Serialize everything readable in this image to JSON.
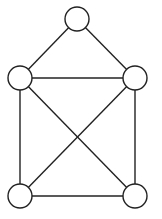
{
  "diagram": {
    "type": "graph",
    "stroke_color": "#222222",
    "fill_color": "#ffffff",
    "node_radius": 12,
    "nodes": [
      {
        "id": "top",
        "x": 77,
        "y": 19
      },
      {
        "id": "left-mid",
        "x": 20,
        "y": 78
      },
      {
        "id": "right-mid",
        "x": 135,
        "y": 78
      },
      {
        "id": "bottom-left",
        "x": 20,
        "y": 196
      },
      {
        "id": "bottom-right",
        "x": 135,
        "y": 196
      }
    ],
    "edges": [
      [
        "top",
        "left-mid"
      ],
      [
        "top",
        "right-mid"
      ],
      [
        "left-mid",
        "right-mid"
      ],
      [
        "left-mid",
        "bottom-left"
      ],
      [
        "right-mid",
        "bottom-right"
      ],
      [
        "bottom-left",
        "bottom-right"
      ],
      [
        "left-mid",
        "bottom-right"
      ],
      [
        "right-mid",
        "bottom-left"
      ]
    ]
  }
}
